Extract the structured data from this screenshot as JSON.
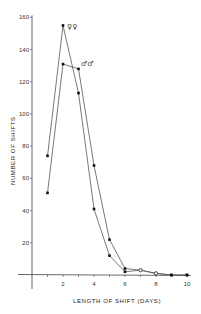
{
  "chart_data": {
    "type": "line",
    "title": "",
    "xlabel": "LENGTH OF SHIFT (DAYS)",
    "ylabel": "NUMBER OF SHIFTS",
    "x": [
      1,
      2,
      3,
      4,
      5,
      6,
      7,
      8,
      9,
      10
    ],
    "x_ticks": [
      2,
      4,
      6,
      8,
      10
    ],
    "y_ticks": [
      20,
      40,
      60,
      80,
      100,
      120,
      140,
      160
    ],
    "xlim": [
      0,
      10
    ],
    "ylim": [
      0,
      160
    ],
    "grid": false,
    "legend_position": "inline labels near peaks",
    "series": [
      {
        "name": "♀♀",
        "values": [
          74,
          155,
          113,
          41,
          12,
          2,
          3,
          1,
          0,
          0
        ]
      },
      {
        "name": "♂♂",
        "values": [
          51,
          131,
          128,
          68,
          22,
          4,
          3,
          1,
          0,
          0
        ]
      }
    ]
  },
  "labels": {
    "xlabel": "LENGTH OF SHIFT (DAYS)",
    "ylabel": "NUMBER OF SHIFTS",
    "female": "♀♀",
    "male": "♂♂"
  },
  "colors": {
    "line": "#555555",
    "marker": "#111111",
    "axis": "#444444"
  }
}
